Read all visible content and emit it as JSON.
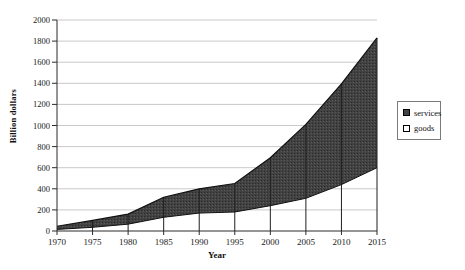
{
  "page": {
    "background": "#ffffff"
  },
  "colors": {
    "gridline": "#c9c9c9",
    "axis": "#2b2b2b",
    "line": "#111111",
    "drop_line": "#1f1f1f",
    "services_fill": "#424242",
    "services_speckle_dark": "#2a2a2a",
    "services_speckle_light": "#5a5a5a",
    "goods_fill": "#ffffff",
    "legend_border": "#7a7a7a"
  },
  "axes": {
    "x_label": "Year",
    "y_label": "Billion dollars"
  },
  "legend": {
    "items": [
      {
        "label": "services",
        "swatch": "filled"
      },
      {
        "label": "goods",
        "swatch": "empty"
      }
    ]
  },
  "chart_data": {
    "type": "area",
    "stacked": true,
    "title": "",
    "xlabel": "Year",
    "ylabel": "Billion dollars",
    "categories": [
      1970,
      1975,
      1980,
      1985,
      1990,
      1995,
      2000,
      2005,
      2010,
      2015
    ],
    "series": [
      {
        "name": "goods",
        "values": [
          15,
          35,
          65,
          130,
          170,
          180,
          240,
          310,
          440,
          600
        ]
      },
      {
        "name": "services",
        "values": [
          30,
          65,
          95,
          190,
          230,
          270,
          455,
          700,
          955,
          1230
        ]
      }
    ],
    "stacked_top_boundary": [
      45,
      100,
      160,
      320,
      400,
      450,
      695,
      1010,
      1395,
      1830
    ],
    "ylim": [
      0,
      2000
    ],
    "ytick_step": 200,
    "grid": "horizontal",
    "drop_lines_at_categories": true,
    "legend_position": "right"
  }
}
